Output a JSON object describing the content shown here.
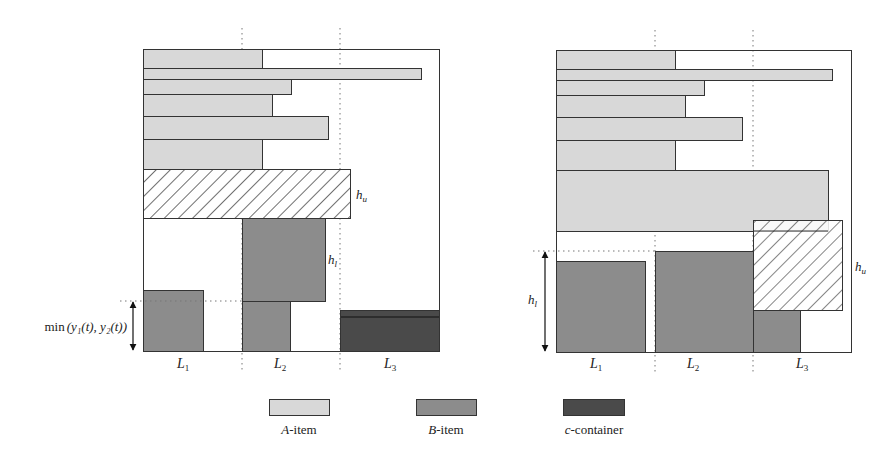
{
  "colors": {
    "a_item": "#d8d8d8",
    "b_item": "#8c8c8c",
    "c_container": "#4a4a4a",
    "stroke": "#333333",
    "hatch": "#222222",
    "dotted": "#777777"
  },
  "left_panel": {
    "lanes": [
      "L",
      "L",
      "L"
    ],
    "lane_subscripts": [
      "1",
      "2",
      "3"
    ],
    "hu_label": "h",
    "hu_sub": "u",
    "hl_label": "h",
    "hl_sub": "l",
    "min_label_prefix": "min",
    "min_label_args": "(y₁(t), y₂(t))"
  },
  "right_panel": {
    "lanes": [
      "L",
      "L",
      "L"
    ],
    "lane_subscripts": [
      "1",
      "2",
      "3"
    ],
    "hu_label": "h",
    "hu_sub": "u",
    "hl_label": "h",
    "hl_sub": "l"
  },
  "legend": {
    "items": [
      {
        "prefix": "A",
        "suffix": "-item"
      },
      {
        "prefix": "B",
        "suffix": "-item"
      },
      {
        "prefix": "c",
        "suffix": "-container"
      }
    ]
  }
}
